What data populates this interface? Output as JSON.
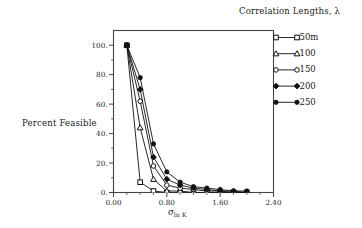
{
  "chart_data": {
    "type": "line",
    "title": "",
    "xlabel": "σln K",
    "xlabel_base": "σ",
    "xlabel_sub": "ln K",
    "ylabel": "Percent Feasible",
    "xlim": [
      0.0,
      2.4
    ],
    "ylim": [
      0,
      110
    ],
    "xticks": [
      "0.00",
      "0.80",
      "1.60",
      "2.40"
    ],
    "xtick_values": [
      0.0,
      0.8,
      1.6,
      2.4
    ],
    "yticks": [
      "0.",
      "20.",
      "40.",
      "60.",
      "80.",
      "100."
    ],
    "ytick_values": [
      0,
      20,
      40,
      60,
      80,
      100
    ],
    "grid": false,
    "legend_position": "right-outside",
    "legend_title": "Correlation Lengths, λ",
    "series": [
      {
        "name": "50m",
        "marker": "square",
        "x": [
          0.2,
          0.4,
          0.6,
          0.8,
          1.0,
          1.2,
          1.4,
          1.6,
          1.8,
          2.0
        ],
        "values": [
          100,
          7,
          1,
          0,
          0,
          0,
          0,
          0,
          0,
          0
        ]
      },
      {
        "name": "100",
        "marker": "triangle",
        "x": [
          0.2,
          0.4,
          0.6,
          0.8,
          1.0,
          1.2,
          1.4,
          1.6,
          1.8,
          2.0
        ],
        "values": [
          100,
          44,
          9,
          1,
          1,
          0,
          0,
          0,
          0,
          0
        ]
      },
      {
        "name": "150",
        "marker": "circle-open",
        "x": [
          0.2,
          0.4,
          0.6,
          0.8,
          1.0,
          1.2,
          1.4,
          1.6,
          1.8,
          2.0
        ],
        "values": [
          100,
          62,
          18,
          5,
          3,
          2,
          1,
          1,
          0,
          0
        ]
      },
      {
        "name": "200",
        "marker": "diamond",
        "x": [
          0.2,
          0.4,
          0.6,
          0.8,
          1.0,
          1.2,
          1.4,
          1.6,
          1.8,
          2.0
        ],
        "values": [
          100,
          70,
          24,
          9,
          5,
          3,
          2,
          1,
          1,
          0
        ]
      },
      {
        "name": "250",
        "marker": "circle-filled",
        "x": [
          0.2,
          0.4,
          0.6,
          0.8,
          1.0,
          1.2,
          1.4,
          1.6,
          1.8,
          2.0
        ],
        "values": [
          100,
          78,
          33,
          14,
          7,
          4,
          3,
          2,
          1,
          1
        ]
      }
    ],
    "colors": {
      "line": "#111111",
      "frame": "#444444",
      "text": "#1a1a1a"
    }
  }
}
